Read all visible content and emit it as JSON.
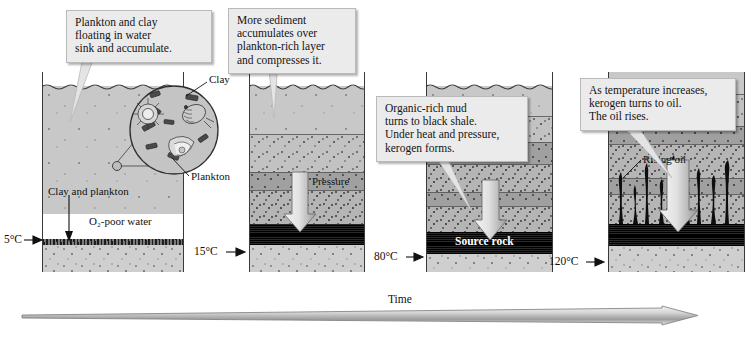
{
  "figure": {
    "time_axis_label": "Time"
  },
  "callouts": [
    {
      "id": "callout-1",
      "text": "Plankton and clay\nfloating in water\nsink and accumulate."
    },
    {
      "id": "callout-2",
      "text": "More sediment\naccumulates over\nplankton-rich layer\nand compresses it."
    },
    {
      "id": "callout-3",
      "text": "Organic-rich mud\nturns to black shale.\nUnder heat and pressure,\nkerogen forms."
    },
    {
      "id": "callout-4",
      "text": "As temperature increases,\nkerogen turns to oil.\nThe oil rises."
    }
  ],
  "panels": [
    {
      "id": "panel-1",
      "temperature": "5°C",
      "labels": {
        "clay": "Clay",
        "plankton": "Plankton",
        "sinking": "Clay and plankton",
        "water": "O₂-poor water"
      }
    },
    {
      "id": "panel-2",
      "temperature": "15°C",
      "labels": {
        "pressure": "Pressure"
      }
    },
    {
      "id": "panel-3",
      "temperature": "80°C",
      "labels": {
        "source_rock": "Source rock"
      }
    },
    {
      "id": "panel-4",
      "temperature": "120°C",
      "labels": {
        "rising_oil": "Rising oil"
      }
    }
  ],
  "colors": {
    "water": "#c8c8c8",
    "sediment_light": "#cfcfcf",
    "sediment_mid": "#c2c2c2",
    "sediment_dense": "#b5b5b5",
    "shale": "#0b0b0b",
    "callout_background": "#ebebeb",
    "outline": "#3a3a3a",
    "arrow_fill": "#d5d5d5",
    "text": "#111111"
  }
}
